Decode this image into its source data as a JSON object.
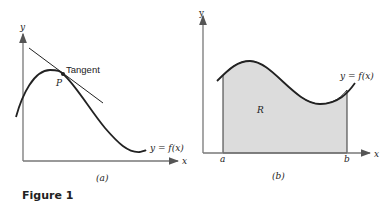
{
  "figure": {
    "caption": "Figure 1",
    "panel_a": {
      "label": "(a)",
      "x_axis_label": "x",
      "y_axis_label": "y",
      "curve_label": "y = f(x)",
      "point_label": "P",
      "tangent_label": "Tangent"
    },
    "panel_b": {
      "label": "(b)",
      "x_axis_label": "x",
      "y_axis_label": "y",
      "curve_label": "y = f(x)",
      "region_label": "R",
      "lower_bound_label": "a",
      "upper_bound_label": "b"
    },
    "colors": {
      "axis": "#555555",
      "curve": "#222222",
      "region_fill": "#dcdcdc"
    }
  }
}
